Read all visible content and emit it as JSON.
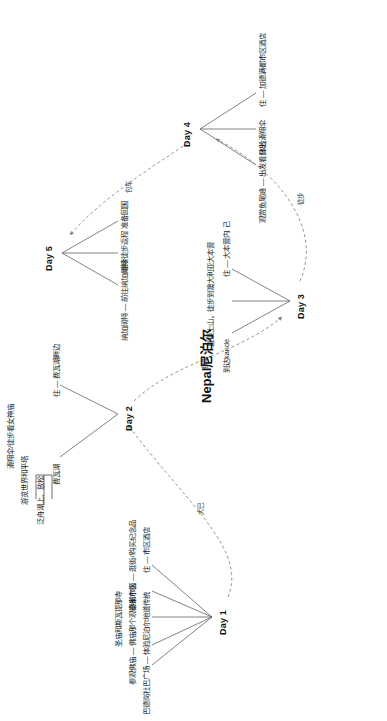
{
  "title": "Nepal尼泊尔",
  "days": [
    {
      "id": "day1",
      "label": "Day 1",
      "items": [
        "巴德岗杜巴广场 — 体验尼泊尔地道传统",
        "参观佛庙 — 佛庙那个观德都市区",
        "圣庙和斯瓦提那寺",
        "泰米尔街 — 逛街/购买纪念品",
        "住 — 市区酒店"
      ]
    },
    {
      "id": "day2",
      "label": "Day 2",
      "items": [
        "费瓦湖",
        "泛舟湖上、放松",
        "游览世界和平塔",
        "滑翔伞/徒步看女神庙",
        "住 — 费瓦湖畔边"
      ],
      "bracket_items": [
        "泛舟湖上、放松",
        "游览世界和平塔",
        "滑翔伞/徒步看女神庙"
      ]
    },
    {
      "id": "day3",
      "label": "Day 3",
      "items": [
        "到达kande",
        "直接上山，徒步到澳大利亚大本营",
        "住 — 大本营内 己"
      ]
    },
    {
      "id": "day4",
      "label": "Day 4",
      "items": [
        "观赏鱼尾峰 — 出发看日出",
        "体验滑翔伞",
        "住 — 加德满都市区酒店"
      ]
    },
    {
      "id": "day5",
      "label": "Day 5",
      "items": [
        "纳加阔特 — 前往纳加阔特",
        "继续徒步返程",
        "准备回国"
      ]
    }
  ],
  "edges": [
    {
      "id": "edge-day1-day2",
      "label": "大巴",
      "from": "Day 1",
      "to": "Day 2"
    },
    {
      "id": "edge-day2-day3",
      "label": "包车",
      "from": "Day 2",
      "to": "Day 3"
    },
    {
      "id": "edge-day3-day4",
      "label": "徒步",
      "from": "Day 3",
      "to": "Day 4"
    },
    {
      "id": "edge-day4-day5",
      "label": "包车",
      "from": "Day 4",
      "to": "Day 5"
    }
  ],
  "colors": {
    "text": "#111111",
    "line": "#4a4a4a",
    "dashed_line": "#7a7a7a",
    "background": "#ffffff"
  }
}
